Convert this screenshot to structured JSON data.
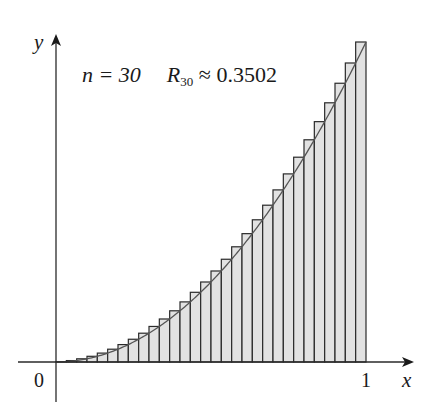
{
  "chart_data": {
    "type": "bar",
    "subtype": "riemann-sum-right-endpoints",
    "function": "y = x^2",
    "n": 30,
    "x_range": [
      0,
      1
    ],
    "ylim": [
      0,
      1
    ],
    "xlabel": "x",
    "ylabel": "y",
    "x_tick_labels": [
      "0",
      "1"
    ],
    "annotation": {
      "n_text": "n = 30",
      "r_symbol": "R",
      "r_subscript": "30",
      "r_value_text": "≈ 0.3502"
    },
    "categories": [
      "1/30",
      "2/30",
      "3/30",
      "4/30",
      "5/30",
      "6/30",
      "7/30",
      "8/30",
      "9/30",
      "10/30",
      "11/30",
      "12/30",
      "13/30",
      "14/30",
      "15/30",
      "16/30",
      "17/30",
      "18/30",
      "19/30",
      "20/30",
      "21/30",
      "22/30",
      "23/30",
      "24/30",
      "25/30",
      "26/30",
      "27/30",
      "28/30",
      "29/30",
      "30/30"
    ],
    "values": [
      0.0011,
      0.0044,
      0.01,
      0.0178,
      0.0278,
      0.04,
      0.0544,
      0.0711,
      0.09,
      0.1111,
      0.1344,
      0.16,
      0.1878,
      0.2178,
      0.25,
      0.2844,
      0.3211,
      0.36,
      0.4011,
      0.4444,
      0.49,
      0.5378,
      0.5878,
      0.64,
      0.6944,
      0.7511,
      0.81,
      0.8711,
      0.9344,
      1.0
    ],
    "grid": false,
    "legend": "none",
    "colors": {
      "bar_fill": "#e2e2e2",
      "bar_stroke": "#2a2a2a",
      "curve": "#555555",
      "axis": "#2a2a2a"
    }
  },
  "axes": {
    "x_label": "x",
    "y_label": "y",
    "tick_0": "0",
    "tick_1": "1"
  }
}
